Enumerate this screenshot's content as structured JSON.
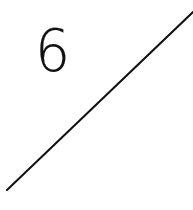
{
  "label": {
    "text": "6"
  },
  "line": {
    "x1": 7,
    "y1": 190,
    "x2": 193,
    "y2": 12,
    "color": "#111111",
    "width": 2
  }
}
